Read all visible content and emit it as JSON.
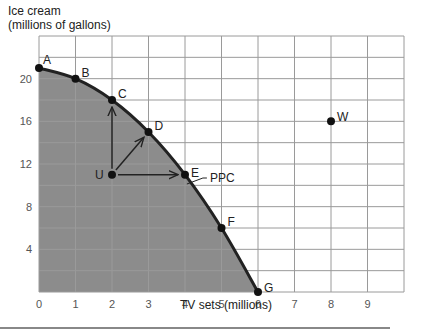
{
  "chart_data": {
    "type": "line",
    "title": "",
    "ylabel": "Ice cream",
    "ylabel_sub": "(millions of gallons)",
    "xlabel": "TV sets (millions)",
    "xlim": [
      0,
      10
    ],
    "ylim": [
      0,
      24
    ],
    "xticks": [
      0,
      1,
      2,
      3,
      4,
      5,
      6,
      7,
      8,
      9
    ],
    "yticks": [
      4,
      8,
      12,
      16,
      20
    ],
    "grid": true,
    "series": [
      {
        "name": "PPC",
        "points": [
          {
            "label": "A",
            "x": 0,
            "y": 21
          },
          {
            "label": "B",
            "x": 1,
            "y": 20
          },
          {
            "label": "C",
            "x": 2,
            "y": 18
          },
          {
            "label": "D",
            "x": 3,
            "y": 15
          },
          {
            "label": "E",
            "x": 4,
            "y": 11
          },
          {
            "label": "F",
            "x": 5,
            "y": 6
          },
          {
            "label": "G",
            "x": 6,
            "y": 0
          }
        ]
      }
    ],
    "extra_points": [
      {
        "label": "U",
        "x": 2,
        "y": 11
      },
      {
        "label": "W",
        "x": 8,
        "y": 16
      }
    ],
    "arrows": [
      {
        "from": "U",
        "to": "C"
      },
      {
        "from": "U",
        "to": "D"
      },
      {
        "from": "U",
        "to": "E"
      }
    ],
    "annotations": [
      {
        "text": "PPC",
        "x": 4.6,
        "y": 10.5
      }
    ],
    "shaded_region": "area under PPC",
    "colors": {
      "shade": "#8c8c8c",
      "curve": "#222222",
      "grid": "#9a9a9a"
    }
  }
}
